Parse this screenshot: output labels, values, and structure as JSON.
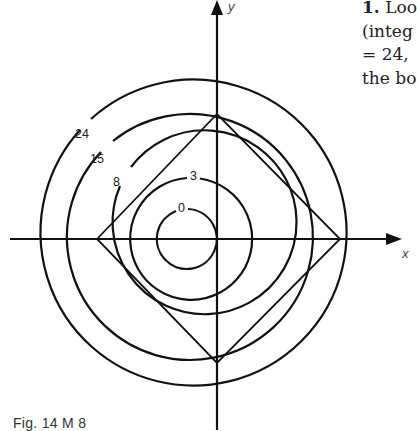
{
  "figure": {
    "caption": "Fig. 14 M 8",
    "axes": {
      "x_label": "x",
      "y_label": "y"
    },
    "contours": [
      {
        "label": "0",
        "cx": 188,
        "cy": 239,
        "r": 30
      },
      {
        "label": "3",
        "cx": 188,
        "cy": 239,
        "r": 61
      },
      {
        "label": "8",
        "cx": 188,
        "cy": 239,
        "r": 92
      },
      {
        "label": "15",
        "cx": 188,
        "cy": 239,
        "r": 123
      },
      {
        "label": "24",
        "cx": 188,
        "cy": 239,
        "r": 153
      }
    ],
    "diamond_vertices": [
      [
        97,
        239
      ],
      [
        217,
        114
      ],
      [
        340,
        239
      ],
      [
        217,
        363
      ]
    ]
  },
  "text": {
    "line1_num": "1.",
    "line1_rest": " Loo",
    "line2": "(integ",
    "line3": "= 24,",
    "line4": "the bo"
  }
}
